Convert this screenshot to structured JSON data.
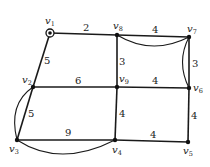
{
  "diagram": {
    "type": "weighted-graph",
    "nodes": [
      {
        "id": "v1",
        "label": "v",
        "sub": "1",
        "x": 50,
        "y": 33,
        "start": true
      },
      {
        "id": "v2",
        "label": "v",
        "sub": "2",
        "x": 33,
        "y": 87
      },
      {
        "id": "v3",
        "label": "v",
        "sub": "3",
        "x": 17,
        "y": 140
      },
      {
        "id": "v4",
        "label": "v",
        "sub": "4",
        "x": 115,
        "y": 140
      },
      {
        "id": "v5",
        "label": "v",
        "sub": "5",
        "x": 188,
        "y": 142
      },
      {
        "id": "v6",
        "label": "v",
        "sub": "6",
        "x": 189,
        "y": 88
      },
      {
        "id": "v7",
        "label": "v",
        "sub": "7",
        "x": 189,
        "y": 37
      },
      {
        "id": "v8",
        "label": "v",
        "sub": "8",
        "x": 117,
        "y": 35
      },
      {
        "id": "v9",
        "label": "v",
        "sub": "9",
        "x": 117,
        "y": 87
      }
    ],
    "edges": [
      {
        "from": "v1",
        "to": "v8",
        "weight": "2"
      },
      {
        "from": "v8",
        "to": "v7",
        "weight": "4"
      },
      {
        "from": "v7",
        "to": "v6",
        "weight": "3"
      },
      {
        "from": "v1",
        "to": "v2",
        "weight": "5"
      },
      {
        "from": "v8",
        "to": "v9",
        "weight": "3"
      },
      {
        "from": "v2",
        "to": "v9",
        "weight": "6"
      },
      {
        "from": "v9",
        "to": "v6",
        "weight": "4"
      },
      {
        "from": "v2",
        "to": "v3",
        "weight": "5"
      },
      {
        "from": "v3",
        "to": "v4",
        "weight": "9"
      },
      {
        "from": "v9",
        "to": "v4",
        "weight": "4"
      },
      {
        "from": "v6",
        "to": "v5",
        "weight": "4"
      },
      {
        "from": "v4",
        "to": "v5",
        "weight": "4"
      }
    ],
    "highlighted_paths": [
      {
        "from": "v8",
        "to": "v7"
      },
      {
        "from": "v7",
        "to": "v6"
      },
      {
        "from": "v2",
        "to": "v3"
      },
      {
        "from": "v3",
        "to": "v4"
      }
    ]
  }
}
